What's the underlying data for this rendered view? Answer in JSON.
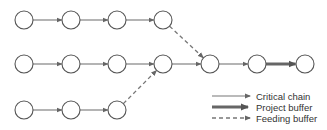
{
  "diagram": {
    "type": "critical-chain-network",
    "colors": {
      "node_stroke": "#555555",
      "edge": "#777777",
      "buffer": "#666666",
      "text": "#333333"
    },
    "nodes": [
      {
        "id": "a1",
        "x": 24,
        "y": 20
      },
      {
        "id": "a2",
        "x": 71,
        "y": 20
      },
      {
        "id": "a3",
        "x": 117,
        "y": 20
      },
      {
        "id": "a4",
        "x": 163,
        "y": 20
      },
      {
        "id": "b1",
        "x": 24,
        "y": 64
      },
      {
        "id": "b2",
        "x": 71,
        "y": 64
      },
      {
        "id": "b3",
        "x": 117,
        "y": 64
      },
      {
        "id": "b4",
        "x": 163,
        "y": 64
      },
      {
        "id": "b5",
        "x": 210,
        "y": 64
      },
      {
        "id": "b6",
        "x": 257,
        "y": 64
      },
      {
        "id": "b7",
        "x": 305,
        "y": 64
      },
      {
        "id": "c1",
        "x": 24,
        "y": 110
      },
      {
        "id": "c2",
        "x": 71,
        "y": 110
      },
      {
        "id": "c3",
        "x": 117,
        "y": 110
      }
    ],
    "edges": [
      {
        "from": "a1",
        "to": "a2",
        "kind": "critical"
      },
      {
        "from": "a2",
        "to": "a3",
        "kind": "critical"
      },
      {
        "from": "a3",
        "to": "a4",
        "kind": "critical"
      },
      {
        "from": "a4",
        "to": "b5",
        "kind": "feeding"
      },
      {
        "from": "b1",
        "to": "b2",
        "kind": "critical"
      },
      {
        "from": "b2",
        "to": "b3",
        "kind": "critical"
      },
      {
        "from": "b3",
        "to": "b4",
        "kind": "critical"
      },
      {
        "from": "b4",
        "to": "b5",
        "kind": "critical"
      },
      {
        "from": "b5",
        "to": "b6",
        "kind": "critical"
      },
      {
        "from": "b6",
        "to": "b7",
        "kind": "project"
      },
      {
        "from": "c1",
        "to": "c2",
        "kind": "critical"
      },
      {
        "from": "c2",
        "to": "c3",
        "kind": "critical"
      },
      {
        "from": "c3",
        "to": "b4",
        "kind": "feeding"
      }
    ]
  },
  "legend": {
    "items": [
      {
        "kind": "critical",
        "label": "Critical chain"
      },
      {
        "kind": "project",
        "label": "Project buffer"
      },
      {
        "kind": "feeding",
        "label": "Feeding buffer"
      }
    ]
  }
}
